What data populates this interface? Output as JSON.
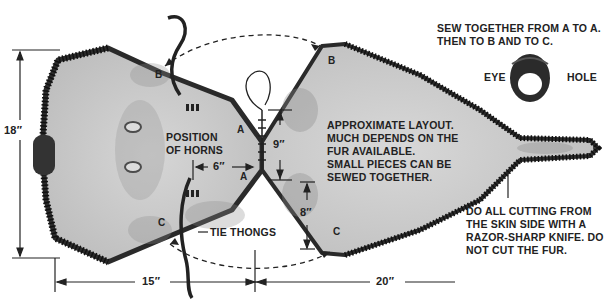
{
  "diagram": {
    "title_note": [
      "SEW TOGETHER FROM A TO A.",
      "THEN TO B AND TO C."
    ],
    "eye_hole": {
      "left": "EYE",
      "right": "HOLE"
    },
    "layout_note": [
      "APPROXIMATE LAYOUT.",
      "MUCH DEPENDS ON THE",
      "FUR AVAILABLE.",
      "SMALL PIECES CAN BE",
      "SEWED TOGETHER."
    ],
    "cutting_note": [
      "DO ALL CUTTING FROM",
      "THE SKIN SIDE WITH A",
      "RAZOR-SHARP KNIFE. DO",
      "NOT CUT THE FUR."
    ],
    "horns_label": [
      "POSITION",
      "OF HORNS"
    ],
    "tie_thongs_label": "TIE THONGS",
    "points": {
      "a_left": "A",
      "a_right": "A",
      "b_left": "B",
      "b_right": "B",
      "c_left": "C",
      "c_right": "C"
    },
    "dimensions": {
      "height_left": "18″",
      "width_left": "15″",
      "width_right": "20″",
      "horn_offset": "6″",
      "upper_right": "9″",
      "lower_right": "8″"
    },
    "colors": {
      "skin": "#c9c9c9",
      "fur": "#2a2a2a",
      "ink": "#1a1a1a",
      "background": "#ffffff"
    }
  }
}
